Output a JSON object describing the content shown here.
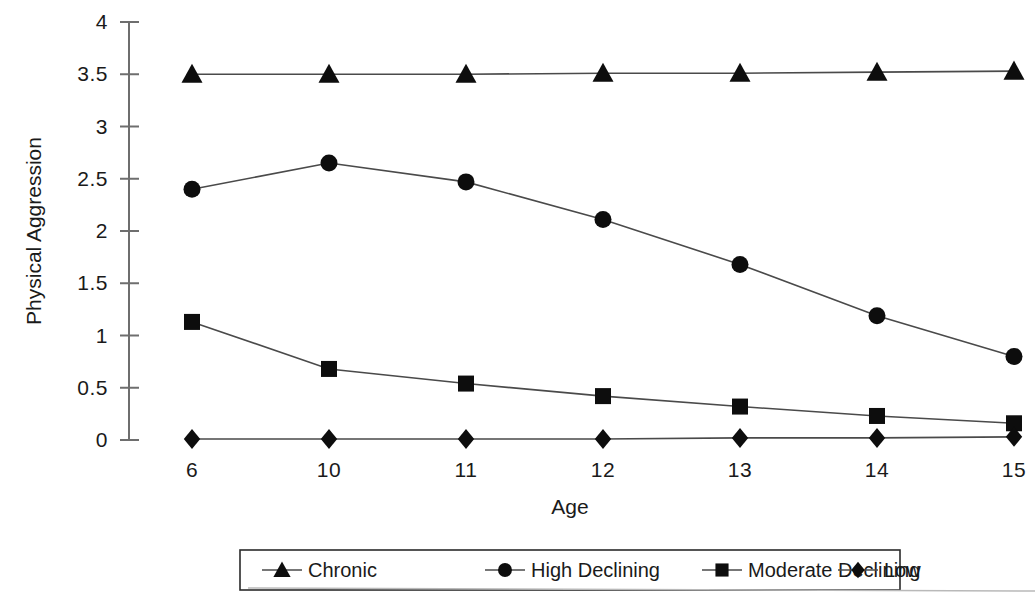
{
  "chart_data": {
    "type": "line",
    "title": "",
    "xlabel": "Age",
    "ylabel": "Physical Aggression",
    "x": [
      6,
      10,
      11,
      12,
      13,
      14,
      15
    ],
    "categories": [
      "6",
      "10",
      "11",
      "12",
      "13",
      "14",
      "15"
    ],
    "xtick_labels": [
      "6",
      "10",
      "11",
      "12",
      "13",
      "14",
      "15"
    ],
    "ytick_labels": [
      "0",
      "0.5",
      "1",
      "1.5",
      "2",
      "2.5",
      "3",
      "3.5",
      "4"
    ],
    "yticks": [
      0,
      0.5,
      1,
      1.5,
      2,
      2.5,
      3,
      3.5,
      4
    ],
    "ylim": [
      0,
      4
    ],
    "grid": false,
    "legend_position": "bottom",
    "series": [
      {
        "name": "Chronic",
        "marker": "triangle",
        "values": [
          3.5,
          3.5,
          3.5,
          3.51,
          3.51,
          3.52,
          3.53
        ]
      },
      {
        "name": "High Declining",
        "marker": "circle",
        "values": [
          2.4,
          2.65,
          2.47,
          2.11,
          1.68,
          1.19,
          0.8
        ]
      },
      {
        "name": "Moderate Declining",
        "marker": "square",
        "values": [
          1.13,
          0.68,
          0.54,
          0.42,
          0.32,
          0.23,
          0.16
        ]
      },
      {
        "name": "Low",
        "marker": "diamond",
        "values": [
          0.01,
          0.01,
          0.01,
          0.01,
          0.02,
          0.02,
          0.03
        ]
      }
    ]
  },
  "colors": {
    "marker": "#0d0d0d",
    "line": "#4a4a4a",
    "axis": "#6e6e6e",
    "text": "#1a1a1a",
    "background": "#ffffff"
  },
  "legend": {
    "items": [
      {
        "label": "Chronic",
        "marker": "triangle"
      },
      {
        "label": "High Declining",
        "marker": "circle"
      },
      {
        "label": "Moderate Declining",
        "marker": "square"
      },
      {
        "label": "Low",
        "marker": "diamond"
      }
    ]
  }
}
